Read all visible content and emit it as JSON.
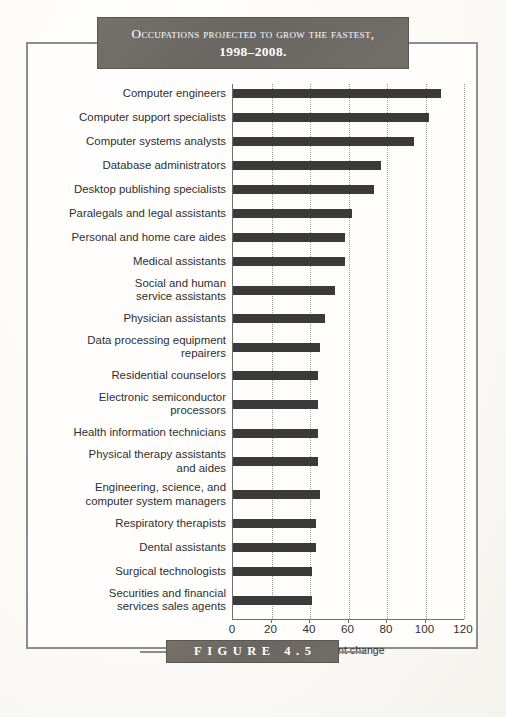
{
  "figure": {
    "title_line1": "Occupations projected to grow the fastest,",
    "title_line2": "1998–2008.",
    "caption": "FIGURE 4.5"
  },
  "chart_data": {
    "type": "bar",
    "orientation": "horizontal",
    "title": "Occupations projected to grow the fastest, 1998–2008.",
    "xlabel": "Percent change",
    "ylabel": "",
    "xlim": [
      0,
      120
    ],
    "xticks": [
      0,
      20,
      40,
      60,
      80,
      100,
      120
    ],
    "grid": "vertical-dotted",
    "legend": "none",
    "bar_color": "#3a3a3a",
    "categories": [
      "Computer engineers",
      "Computer support specialists",
      "Computer systems analysts",
      "Database administrators",
      "Desktop publishing specialists",
      "Paralegals and legal assistants",
      "Personal and home care aides",
      "Medical assistants",
      "Social and human\nservice assistants",
      "Physician assistants",
      "Data processing equipment\nrepairers",
      "Residential counselors",
      "Electronic semiconductor\nprocessors",
      "Health information technicians",
      "Physical therapy assistants\nand aides",
      "Engineering, science, and\ncomputer system managers",
      "Respiratory therapists",
      "Dental assistants",
      "Surgical technologists",
      "Securities and financial\nservices sales agents"
    ],
    "values": [
      108,
      102,
      94,
      77,
      73,
      62,
      58,
      58,
      53,
      48,
      45,
      44,
      44,
      44,
      44,
      45,
      43,
      43,
      41,
      41
    ]
  }
}
